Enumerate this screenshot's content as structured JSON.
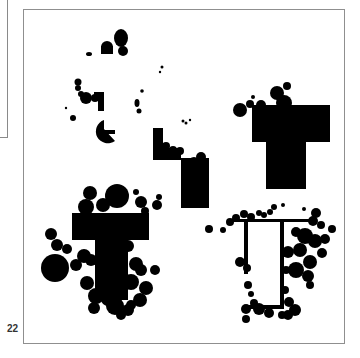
{
  "figure": {
    "panel_label": "22",
    "colors": {
      "ink": "#000000",
      "background": "#ffffff",
      "frame": "#8f8f8f"
    },
    "regions": [
      {
        "name": "top-left-small-clusters",
        "shape": "scattered-blobs"
      },
      {
        "name": "center-upper-stair",
        "shape": "L-step"
      },
      {
        "name": "top-right-T",
        "shape": "T"
      },
      {
        "name": "bottom-left-T",
        "shape": "T"
      },
      {
        "name": "bottom-right-frame-T",
        "shape": "T-outline"
      }
    ]
  }
}
